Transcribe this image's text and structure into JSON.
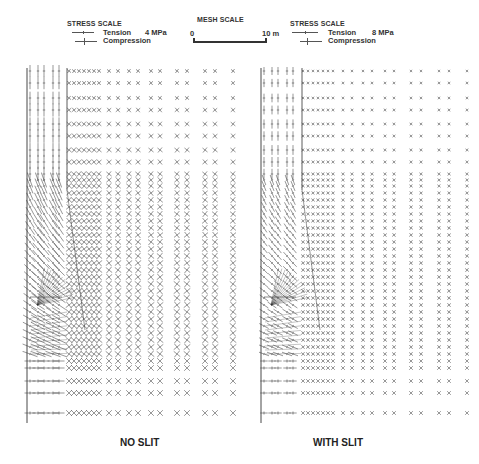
{
  "legend_left": {
    "title": "STRESS SCALE",
    "tension_label": "Tension",
    "tension_value": "4 MPa",
    "compression_label": "Compression"
  },
  "mesh_scale": {
    "title": "MESH SCALE",
    "start_label": "0",
    "end_label": "10 m"
  },
  "legend_right": {
    "title": "STRESS SCALE",
    "tension_label": "Tension",
    "tension_value": "8 MPa",
    "compression_label": "Compression"
  },
  "panels": [
    {
      "id": "no-slit",
      "caption": "NO SLIT",
      "origin_x": 27,
      "inner_line_x": 67,
      "top": 68,
      "bottom": 423,
      "glyph_scale": 1.0
    },
    {
      "id": "with-slit",
      "caption": "WITH SLIT",
      "origin_x": 261,
      "inner_line_x": 302,
      "top": 68,
      "bottom": 423,
      "glyph_scale": 0.55
    }
  ],
  "grid": {
    "near_cols": [
      3,
      11,
      17,
      26,
      32
    ],
    "mid_cols": [
      42,
      47,
      52,
      57,
      62,
      67,
      72
    ],
    "far_cols": [
      82,
      91,
      102,
      111,
      124,
      133,
      150,
      160,
      178,
      188,
      206
    ],
    "rows": [
      71,
      83,
      98,
      110,
      124,
      136,
      150,
      162,
      174,
      180,
      186,
      193,
      200,
      207,
      214,
      221,
      228,
      235,
      242,
      249,
      256,
      263,
      270,
      277,
      284,
      291,
      298,
      305,
      312,
      319,
      326,
      333,
      340,
      347,
      354,
      361,
      368,
      381,
      393,
      413
    ]
  },
  "colors": {
    "ink": "#333333",
    "background": "#ffffff"
  }
}
